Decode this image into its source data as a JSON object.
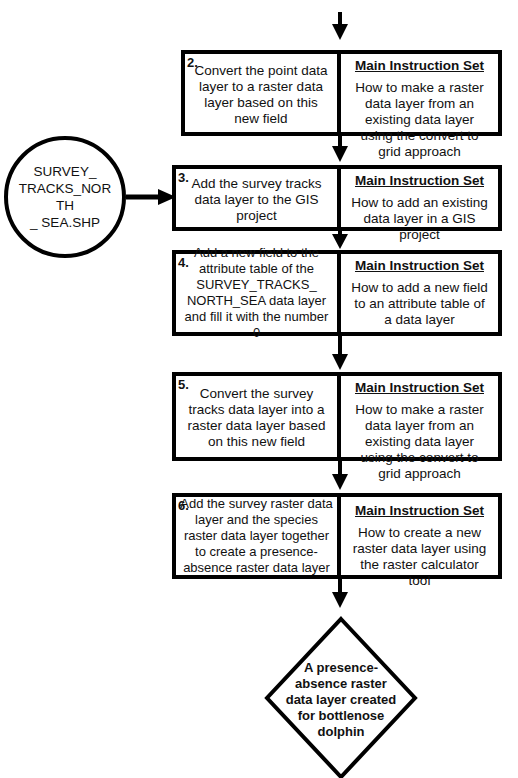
{
  "steps": [
    {
      "number": "2.",
      "action": "Convert the point data layer to a raster data layer based on this new field",
      "instruction_heading": "Main Instruction Set",
      "instruction": "How to make a raster data layer from an existing data layer using the convert to grid approach"
    },
    {
      "number": "3.",
      "action": "Add the survey tracks data layer to the GIS project",
      "instruction_heading": "Main Instruction Set",
      "instruction": "How to add an existing data layer in a GIS project"
    },
    {
      "number": "4.",
      "action": "Add a new field to the attribute table of the SURVEY_TRACKS_ NORTH_SEA data layer and fill it with the number 0",
      "instruction_heading": "Main Instruction Set",
      "instruction": "How to add a new field to an attribute table of a data layer"
    },
    {
      "number": "5.",
      "action": "Convert the survey tracks data layer into a raster data layer based on this new field",
      "instruction_heading": "Main Instruction Set",
      "instruction": "How to make a raster data layer from an existing data layer using the convert to grid approach"
    },
    {
      "number": "6.",
      "action": "Add the survey raster data layer and the species raster data layer together to create a presence-absence raster data layer",
      "instruction_heading": "Main Instruction Set",
      "instruction": "How to create  a new raster data layer using the raster calculator tool"
    }
  ],
  "input_node": {
    "label": "SURVEY_ TRACKS_NORTH _ SEA.SHP"
  },
  "output_node": {
    "label": "A presence-absence raster data layer created for bottlenose dolphin"
  }
}
